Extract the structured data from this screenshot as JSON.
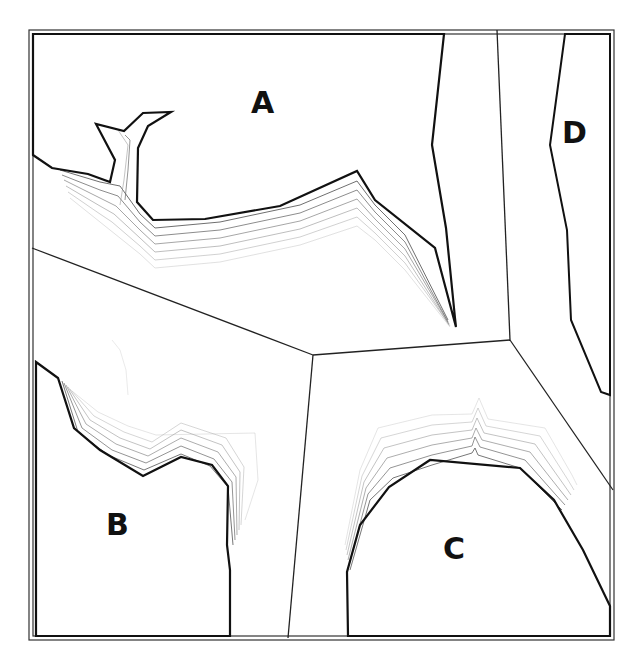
{
  "diagram": {
    "type": "region-map-with-contours",
    "regions": [
      {
        "id": "A",
        "label": "A",
        "x": 266,
        "y": 104
      },
      {
        "id": "B",
        "label": "B",
        "x": 118,
        "y": 525
      },
      {
        "id": "C",
        "label": "C",
        "x": 456,
        "y": 548
      },
      {
        "id": "D",
        "label": "D",
        "x": 574,
        "y": 135
      }
    ],
    "colors": {
      "stroke": "#1a1a1a",
      "frame": "#333333",
      "background": "#ffffff"
    }
  }
}
